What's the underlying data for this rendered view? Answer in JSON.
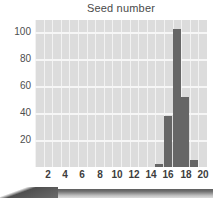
{
  "chart_data": {
    "type": "bar",
    "title": "Seed number",
    "xlabel": "",
    "ylabel": "",
    "categories": [
      1,
      2,
      3,
      4,
      5,
      6,
      7,
      8,
      9,
      10,
      11,
      12,
      13,
      14,
      15,
      16,
      17,
      18,
      19,
      20
    ],
    "values": [
      0,
      0,
      0,
      0,
      0,
      0,
      0,
      0,
      0,
      0,
      0,
      0,
      0,
      0,
      2,
      38,
      102,
      52,
      5,
      0
    ],
    "xticks": [
      "2",
      "4",
      "6",
      "8",
      "10",
      "12",
      "14",
      "16",
      "18",
      "20"
    ],
    "xtick_values": [
      2,
      4,
      6,
      8,
      10,
      12,
      14,
      16,
      18,
      20
    ],
    "yticks": [
      "20",
      "40",
      "60",
      "80",
      "100"
    ],
    "ytick_values": [
      20,
      40,
      60,
      80,
      100
    ],
    "xlim": [
      0.5,
      20.5
    ],
    "ylim": [
      0,
      109
    ],
    "grid": true,
    "legend": false,
    "bar_color": "#666666",
    "plot_background": "#dcdcdc",
    "gridline_color": "#f4f4f4",
    "title_color": "#4a4a4a",
    "tick_color": "#3d3d3d"
  },
  "figure": {
    "background": "#ffffff",
    "bottom_band_color": "#6e6e6e"
  }
}
